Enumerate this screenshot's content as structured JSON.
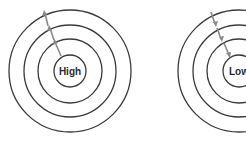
{
  "diagram": {
    "figures": [
      {
        "id": "high",
        "label": "High",
        "center": [
          70,
          71
        ],
        "radii": [
          16,
          32,
          46,
          61
        ],
        "arrow_direction": "outward"
      },
      {
        "id": "low",
        "label": "Low",
        "center": [
          239,
          71
        ],
        "radii": [
          16,
          32,
          46,
          61
        ],
        "arrow_direction": "inward"
      }
    ],
    "colors": {
      "ring": "#3a3a3a",
      "arrow": "#8a8a8a",
      "background": "#ffffff"
    }
  }
}
